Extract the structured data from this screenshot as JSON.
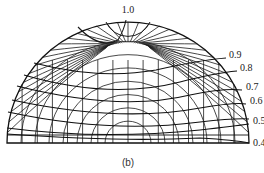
{
  "diagram": {
    "type": "hemispherical-projection-chart",
    "caption": "(b)",
    "contour_labels": [
      {
        "id": "c10",
        "text": "1.0",
        "x": 128,
        "y": 13
      },
      {
        "id": "c09",
        "text": "0.9",
        "x": 229,
        "y": 58
      },
      {
        "id": "c08",
        "text": "0.8",
        "x": 240,
        "y": 71
      },
      {
        "id": "c07",
        "text": "0.7",
        "x": 246,
        "y": 90
      },
      {
        "id": "c06",
        "text": "0.6",
        "x": 250,
        "y": 104
      },
      {
        "id": "c05",
        "text": "0.5",
        "x": 253,
        "y": 124
      },
      {
        "id": "c04",
        "text": "0.4",
        "x": 253,
        "y": 146
      }
    ],
    "center": {
      "x": 128,
      "y": 143
    },
    "radius": 121,
    "line_color": "#1a1a1a"
  }
}
